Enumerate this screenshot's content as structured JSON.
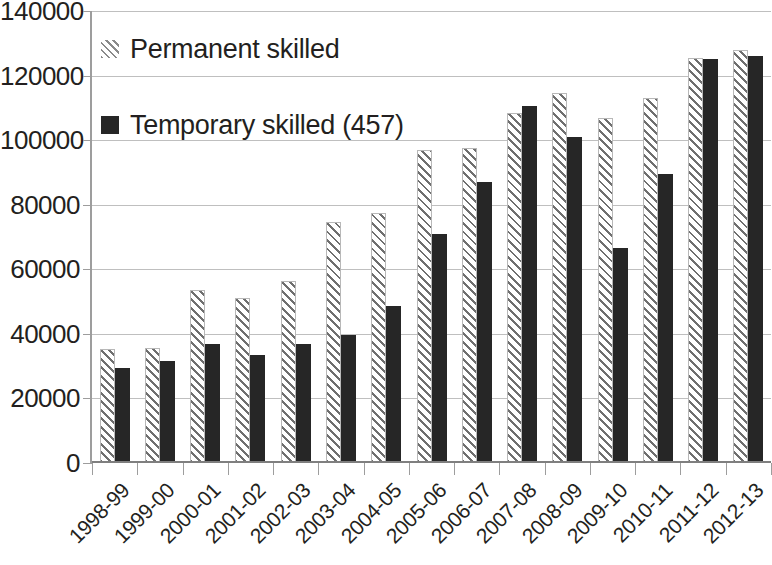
{
  "chart_data": {
    "type": "bar",
    "title": "",
    "subtitle": "",
    "xlabel": "",
    "ylabel": "",
    "ylim": [
      0,
      140000
    ],
    "ytick_step": 20000,
    "ytick_labels": [
      "140000",
      "120000",
      "100000",
      "80000",
      "60000",
      "40000",
      "20000",
      "0"
    ],
    "ytick_values": [
      140000,
      120000,
      100000,
      80000,
      60000,
      40000,
      20000,
      0
    ],
    "grid": true,
    "legend_position": "inside-top-left",
    "categories": [
      "1998-99",
      "1999-00",
      "2000-01",
      "2001-02",
      "2002-03",
      "2003-04",
      "2004-05",
      "2005-06",
      "2006-07",
      "2007-08",
      "2008-09",
      "2009-10",
      "2010-11",
      "2011-12",
      "2012-13"
    ],
    "series": [
      {
        "name": "Permanent skilled",
        "pattern": "diagonal-hatch",
        "color": "#8a8a8a",
        "values": [
          35400,
          35500,
          53500,
          51000,
          56500,
          74500,
          77500,
          97000,
          97500,
          108500,
          114500,
          107000,
          113000,
          125500,
          128000
        ]
      },
      {
        "name": "Temporary skilled (457)",
        "pattern": "solid",
        "color": "#262626",
        "values": [
          29500,
          31500,
          37000,
          33500,
          37000,
          39500,
          48500,
          71000,
          87000,
          110500,
          101000,
          66500,
          89500,
          125000,
          126000
        ]
      }
    ]
  },
  "legend": {
    "items": [
      {
        "label": "Permanent skilled",
        "swatch": "hatch-swatch"
      },
      {
        "label": "Temporary skilled (457)",
        "swatch": "solid-swatch"
      }
    ]
  },
  "colors": {
    "permanent_hatch": "#8a8a8a",
    "temporary_solid": "#262626",
    "gridline": "#bfbfbf",
    "axis": "#9d9d9d",
    "text": "#231f20"
  }
}
